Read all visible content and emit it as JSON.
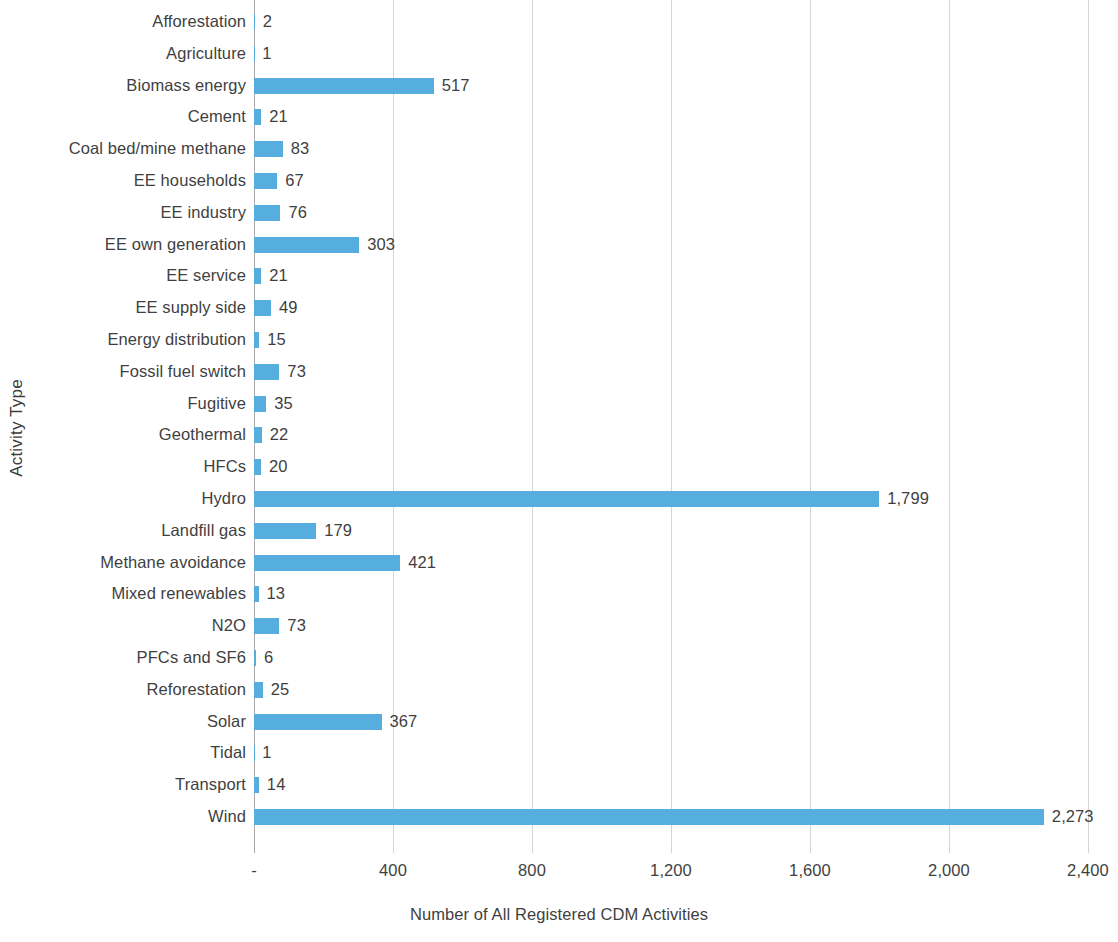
{
  "chart_data": {
    "type": "bar",
    "orientation": "horizontal",
    "title": "",
    "xlabel": "Number of All Registered CDM Activities",
    "ylabel": "Activity Type",
    "xlim": [
      0,
      2400
    ],
    "xticks": [
      0,
      400,
      800,
      1200,
      1600,
      2000,
      2400
    ],
    "xtick_labels": [
      "-",
      "400",
      "800",
      "1,200",
      "1,600",
      "2,000",
      "2,400"
    ],
    "grid": "vertical",
    "legend": "none",
    "bar_color": "#55aede",
    "categories": [
      "Afforestation",
      "Agriculture",
      "Biomass energy",
      "Cement",
      "Coal bed/mine methane",
      "EE households",
      "EE industry",
      "EE own generation",
      "EE service",
      "EE supply side",
      "Energy distribution",
      "Fossil fuel switch",
      "Fugitive",
      "Geothermal",
      "HFCs",
      "Hydro",
      "Landfill gas",
      "Methane avoidance",
      "Mixed renewables",
      "N2O",
      "PFCs and SF6",
      "Reforestation",
      "Solar",
      "Tidal",
      "Transport",
      "Wind"
    ],
    "values": [
      2,
      1,
      517,
      21,
      83,
      67,
      76,
      303,
      21,
      49,
      15,
      73,
      35,
      22,
      20,
      1799,
      179,
      421,
      13,
      73,
      6,
      25,
      367,
      1,
      14,
      2273
    ],
    "value_labels": [
      "2",
      "1",
      "517",
      "21",
      "83",
      "67",
      "76",
      "303",
      "21",
      "49",
      "15",
      "73",
      "35",
      "22",
      "20",
      "1,799",
      "179",
      "421",
      "13",
      "73",
      "6",
      "25",
      "367",
      "1",
      "14",
      "2,273"
    ]
  }
}
